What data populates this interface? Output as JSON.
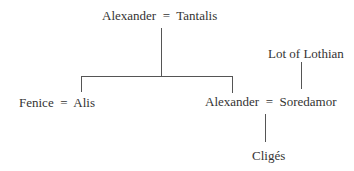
{
  "diagram": {
    "type": "family-tree",
    "nodes": {
      "top_couple": "Alexander  =  Tantalis",
      "left_couple": "Fenice  =  Alis",
      "right_couple": "Alexander  =  Soredamor",
      "lot": "Lot of Lothian",
      "child": "Cligés"
    },
    "colors": {
      "text": "#333333",
      "line": "#555555",
      "background": "#ffffff"
    }
  }
}
